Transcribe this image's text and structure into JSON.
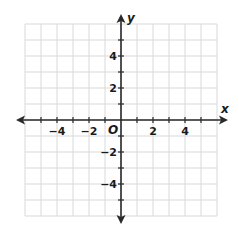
{
  "chart_data": {
    "type": "coordinate-grid",
    "title": "",
    "xlabel": "x",
    "ylabel": "y",
    "origin_label": "O",
    "xlim": [
      -6,
      6
    ],
    "ylim": [
      -6,
      6
    ],
    "grid": true,
    "grid_step": 1,
    "x_tick_labels": [
      {
        "value": -4,
        "text": "−4"
      },
      {
        "value": -2,
        "text": "−2"
      },
      {
        "value": 2,
        "text": "2"
      },
      {
        "value": 4,
        "text": "4"
      }
    ],
    "y_tick_labels": [
      {
        "value": 4,
        "text": "4"
      },
      {
        "value": 2,
        "text": "2"
      },
      {
        "value": -2,
        "text": "−2"
      },
      {
        "value": -4,
        "text": "−4"
      }
    ],
    "series": [],
    "colors": {
      "grid": "#d9d9d9",
      "axis": "#2a2a2a",
      "text": "#1a1a1a"
    }
  }
}
